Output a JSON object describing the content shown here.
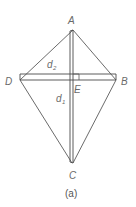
{
  "figure": {
    "caption": "(a)",
    "shape": "kite",
    "vertices": {
      "A": {
        "label": "A",
        "x": 73,
        "y": 30
      },
      "B": {
        "label": "B",
        "x": 116,
        "y": 80
      },
      "C": {
        "label": "C",
        "x": 73,
        "y": 163
      },
      "D": {
        "label": "D",
        "x": 20,
        "y": 80
      }
    },
    "intersection": {
      "label": "E"
    },
    "diagonals": {
      "d1": {
        "label": "d",
        "subscript": "1",
        "from": "A",
        "to": "C"
      },
      "d2": {
        "label": "d",
        "subscript": "2",
        "from": "D",
        "to": "B"
      }
    },
    "right_angle_marker": "at E",
    "colors": {
      "lines": "#5a5a5a",
      "labels": "#6a6a6a",
      "background": "#ffffff"
    }
  }
}
